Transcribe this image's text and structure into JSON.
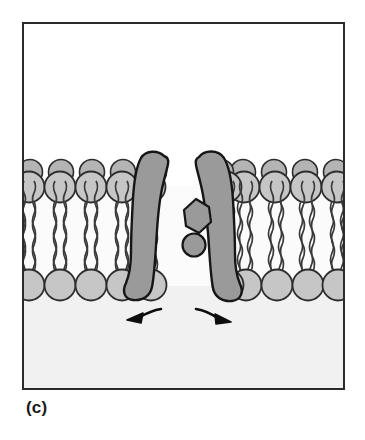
{
  "figure": {
    "caption": "(c)",
    "frame": {
      "x": 22,
      "y": 22,
      "width": 323,
      "height": 368,
      "stroke": "#2b2b2b",
      "stroke_width": 2
    },
    "compartments": {
      "upper": {
        "name": "extracellular-space",
        "fill": "#ffffff",
        "y_top": 22,
        "y_bottom": 163
      },
      "lower": {
        "name": "cytoplasm",
        "fill": "#f1f1f1",
        "y_top": 300,
        "y_bottom": 390
      }
    },
    "colors": {
      "protein_fill": "#9a9a9a",
      "protein_stroke": "#161616",
      "lipid_head_fill": "#c6c6c6",
      "lipid_head_stroke": "#2d2d2d",
      "lipid_tail_stroke": "#3a3a3a",
      "bilayer_core_fill": "#fbfbfb",
      "arrow_color": "#0d0d0d",
      "background": "#ffffff"
    },
    "membrane": {
      "name": "phospholipid-bilayer",
      "outer_leaflet_y": 186,
      "outer_leaflet_back_y": 172,
      "inner_leaflet_y": 285,
      "head_radius": 15.5,
      "head_radius_back": 12,
      "head_spacing": 31,
      "tail_count_per_head": 2,
      "outer_heads_left": 5,
      "outer_heads_right": 5,
      "inner_heads_left": 5,
      "inner_heads_right": 5
    },
    "protein": {
      "name": "channel-protein",
      "subunit_left_label": "left-subunit",
      "subunit_right_label": "right-subunit",
      "pore_state": "open",
      "pore_width_px": 26,
      "inclusions": [
        {
          "shape": "polygon",
          "name": "hexagonal-domain",
          "cx": 196,
          "cy": 216,
          "r": 17
        },
        {
          "shape": "circle",
          "name": "circular-domain",
          "cx": 194,
          "cy": 243,
          "r": 11
        }
      ]
    },
    "arrows": [
      {
        "name": "flow-arrow-left",
        "direction": "left",
        "tip_x": 130,
        "tip_y": 319
      },
      {
        "name": "flow-arrow-right",
        "direction": "right",
        "tip_x": 226,
        "tip_y": 321
      }
    ]
  }
}
